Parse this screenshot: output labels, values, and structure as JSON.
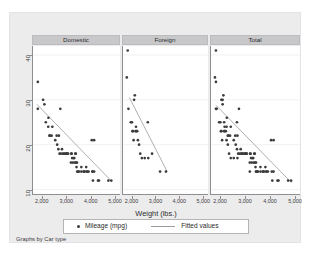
{
  "top_strip": {
    "ghost_text": "                                                                        "
  },
  "figure": {
    "background_color": "#ececed",
    "panel_background_color": "#ffffff",
    "header_band_color": "#c8c8ca",
    "marker_color": "#3c3c3e",
    "fit_line_color": "#9a9a9c",
    "footer_note": "Graphs by Car type"
  },
  "legend": {
    "marker_label": "Mileage (mpg)",
    "line_label": "Fitted values",
    "marker_icon": "filled-circle-marker",
    "line_icon": "line-swatch"
  },
  "chart_data": {
    "type": "scatter",
    "title": "",
    "subtitle": "",
    "xlabel": "Weight (lbs.)",
    "ylabel": "",
    "xlim": [
      1600,
      5200
    ],
    "ylim": [
      9,
      42
    ],
    "xticks": [
      2000,
      3000,
      4000,
      5000
    ],
    "xtick_labels": [
      "2,000",
      "3,000",
      "4,000",
      "5,000"
    ],
    "yticks": [
      10,
      20,
      30,
      40
    ],
    "ytick_labels": [
      "10",
      "20",
      "30",
      "40"
    ],
    "ytick_rotation": 90,
    "grid": "horizontal",
    "legend_position": "bottom",
    "facet_by": "Car type",
    "facet_note": "Graphs by Car type",
    "series_marker_name": "Mileage (mpg)",
    "series_line_name": "Fitted values",
    "panels": [
      {
        "label": "Domestic",
        "points": [
          [
            1800,
            28
          ],
          [
            1800,
            34
          ],
          [
            2020,
            30
          ],
          [
            2070,
            29
          ],
          [
            2130,
            25
          ],
          [
            2230,
            24
          ],
          [
            2240,
            26
          ],
          [
            2280,
            22
          ],
          [
            2300,
            22
          ],
          [
            2370,
            22
          ],
          [
            2400,
            24
          ],
          [
            2520,
            21
          ],
          [
            2580,
            22
          ],
          [
            2600,
            20
          ],
          [
            2650,
            19
          ],
          [
            2670,
            22
          ],
          [
            2700,
            18
          ],
          [
            2730,
            28
          ],
          [
            2750,
            18
          ],
          [
            2800,
            19
          ],
          [
            2830,
            18
          ],
          [
            2880,
            18
          ],
          [
            2930,
            18
          ],
          [
            2980,
            18
          ],
          [
            3000,
            18
          ],
          [
            3020,
            18
          ],
          [
            3050,
            18
          ],
          [
            3170,
            16
          ],
          [
            3180,
            18
          ],
          [
            3200,
            18
          ],
          [
            3220,
            17
          ],
          [
            3250,
            16
          ],
          [
            3280,
            17
          ],
          [
            3310,
            17
          ],
          [
            3330,
            16
          ],
          [
            3350,
            18
          ],
          [
            3370,
            18
          ],
          [
            3380,
            16
          ],
          [
            3400,
            15
          ],
          [
            3420,
            16
          ],
          [
            3430,
            14
          ],
          [
            3470,
            14
          ],
          [
            3500,
            14
          ],
          [
            3600,
            14
          ],
          [
            3600,
            15
          ],
          [
            3690,
            14
          ],
          [
            3720,
            14
          ],
          [
            3740,
            14
          ],
          [
            3800,
            15
          ],
          [
            3830,
            14
          ],
          [
            3850,
            14
          ],
          [
            3900,
            14
          ],
          [
            4030,
            21
          ],
          [
            4060,
            14
          ],
          [
            4060,
            14
          ],
          [
            4080,
            12
          ],
          [
            4130,
            21
          ],
          [
            4130,
            14
          ],
          [
            4290,
            12
          ],
          [
            4330,
            12
          ],
          [
            4720,
            12
          ],
          [
            4840,
            12
          ]
        ],
        "fit_line": {
          "x": [
            1760,
            4860
          ],
          "y": [
            29.0,
            11.8
          ]
        }
      },
      {
        "label": "Foreign",
        "points": [
          [
            1760,
            35
          ],
          [
            1800,
            41
          ],
          [
            1830,
            28
          ],
          [
            1930,
            25
          ],
          [
            1980,
            25
          ],
          [
            2000,
            23
          ],
          [
            2020,
            23
          ],
          [
            2050,
            21
          ],
          [
            2070,
            30
          ],
          [
            2100,
            31
          ],
          [
            2130,
            23
          ],
          [
            2150,
            24
          ],
          [
            2160,
            23
          ],
          [
            2200,
            23
          ],
          [
            2230,
            21
          ],
          [
            2280,
            20
          ],
          [
            2330,
            18
          ],
          [
            2400,
            17
          ],
          [
            2520,
            17
          ],
          [
            2650,
            25
          ],
          [
            2670,
            17
          ],
          [
            2830,
            18
          ],
          [
            3170,
            14
          ],
          [
            3420,
            14
          ]
        ],
        "fit_line": {
          "x": [
            1870,
            3470
          ],
          "y": [
            30.5,
            14.0
          ]
        }
      },
      {
        "label": "Total",
        "points": [
          [
            1760,
            35
          ],
          [
            1800,
            41
          ],
          [
            1800,
            28
          ],
          [
            1800,
            34
          ],
          [
            1830,
            28
          ],
          [
            1930,
            25
          ],
          [
            1980,
            25
          ],
          [
            2000,
            23
          ],
          [
            2020,
            30
          ],
          [
            2020,
            23
          ],
          [
            2050,
            21
          ],
          [
            2070,
            29
          ],
          [
            2070,
            30
          ],
          [
            2100,
            31
          ],
          [
            2130,
            25
          ],
          [
            2130,
            23
          ],
          [
            2150,
            24
          ],
          [
            2160,
            23
          ],
          [
            2200,
            23
          ],
          [
            2230,
            24
          ],
          [
            2230,
            21
          ],
          [
            2240,
            26
          ],
          [
            2280,
            22
          ],
          [
            2280,
            20
          ],
          [
            2300,
            22
          ],
          [
            2330,
            18
          ],
          [
            2370,
            22
          ],
          [
            2400,
            24
          ],
          [
            2400,
            17
          ],
          [
            2520,
            21
          ],
          [
            2520,
            17
          ],
          [
            2580,
            22
          ],
          [
            2600,
            20
          ],
          [
            2650,
            19
          ],
          [
            2650,
            25
          ],
          [
            2670,
            22
          ],
          [
            2670,
            17
          ],
          [
            2700,
            18
          ],
          [
            2730,
            28
          ],
          [
            2750,
            18
          ],
          [
            2800,
            19
          ],
          [
            2830,
            18
          ],
          [
            2830,
            18
          ],
          [
            2880,
            18
          ],
          [
            2930,
            18
          ],
          [
            2980,
            18
          ],
          [
            3000,
            18
          ],
          [
            3020,
            18
          ],
          [
            3050,
            18
          ],
          [
            3170,
            16
          ],
          [
            3170,
            14
          ],
          [
            3180,
            18
          ],
          [
            3200,
            18
          ],
          [
            3220,
            17
          ],
          [
            3250,
            16
          ],
          [
            3280,
            17
          ],
          [
            3310,
            17
          ],
          [
            3330,
            16
          ],
          [
            3350,
            18
          ],
          [
            3370,
            18
          ],
          [
            3380,
            16
          ],
          [
            3400,
            15
          ],
          [
            3420,
            16
          ],
          [
            3420,
            14
          ],
          [
            3430,
            14
          ],
          [
            3470,
            14
          ],
          [
            3500,
            14
          ],
          [
            3600,
            14
          ],
          [
            3600,
            15
          ],
          [
            3690,
            14
          ],
          [
            3720,
            14
          ],
          [
            3740,
            14
          ],
          [
            3800,
            15
          ],
          [
            3830,
            14
          ],
          [
            3850,
            14
          ],
          [
            3900,
            14
          ],
          [
            4030,
            21
          ],
          [
            4060,
            14
          ],
          [
            4080,
            12
          ],
          [
            4130,
            21
          ],
          [
            4130,
            14
          ],
          [
            4290,
            12
          ],
          [
            4330,
            12
          ],
          [
            4720,
            12
          ],
          [
            4840,
            12
          ]
        ],
        "fit_line": {
          "x": [
            1800,
            4860
          ],
          "y": [
            28.8,
            11.5
          ]
        }
      }
    ]
  }
}
